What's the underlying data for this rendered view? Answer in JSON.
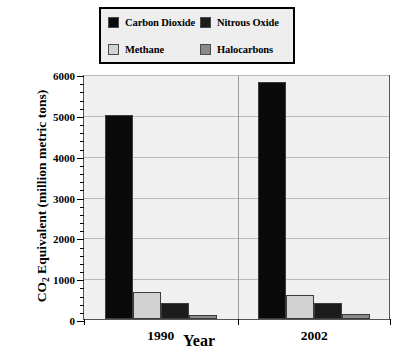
{
  "chart_data": {
    "type": "bar",
    "title": "",
    "xlabel": "Year",
    "ylabel": "CO2 Equivalent  (million metric tons)",
    "ylabel_prefix": "CO",
    "ylabel_sub": "2",
    "ylabel_suffix": " Equivalent  (million metric tons)",
    "categories": [
      "1990",
      "2002"
    ],
    "ylim": [
      0,
      6000
    ],
    "yticks": [
      0,
      1000,
      2000,
      3000,
      4000,
      5000,
      6000
    ],
    "ytick_labels": [
      "0",
      "1000",
      "2000",
      "3000",
      "4000",
      "5000",
      "6000"
    ],
    "minor_tick_step": 200,
    "grid": true,
    "legend_position": "top",
    "series": [
      {
        "name": "Carbon Dioxide",
        "color": "#0a0a0a",
        "values": [
          5000,
          5800
        ]
      },
      {
        "name": "Methane",
        "color": "#d2d2d2",
        "values": [
          670,
          600
        ]
      },
      {
        "name": "Nitrous Oxide",
        "color": "#1c1c1c",
        "values": [
          400,
          400
        ]
      },
      {
        "name": "Halocarbons",
        "color": "#8a8a8a",
        "values": [
          90,
          135
        ]
      }
    ],
    "legend_order": [
      "Carbon Dioxide",
      "Nitrous Oxide",
      "Methane",
      "Halocarbons"
    ]
  },
  "legend": {
    "entries": [
      {
        "label": "Carbon Dioxide",
        "color": "#0a0a0a"
      },
      {
        "label": "Nitrous Oxide",
        "color": "#1c1c1c"
      },
      {
        "label": "Methane",
        "color": "#d2d2d2"
      },
      {
        "label": "Halocarbons",
        "color": "#8a8a8a"
      }
    ]
  },
  "colors": {
    "plot_background": "#f0f0f0",
    "gridline": "#b9b9b9",
    "axis": "#000000",
    "legend_background": "#eeeeee",
    "page_background": "#ffffff"
  }
}
